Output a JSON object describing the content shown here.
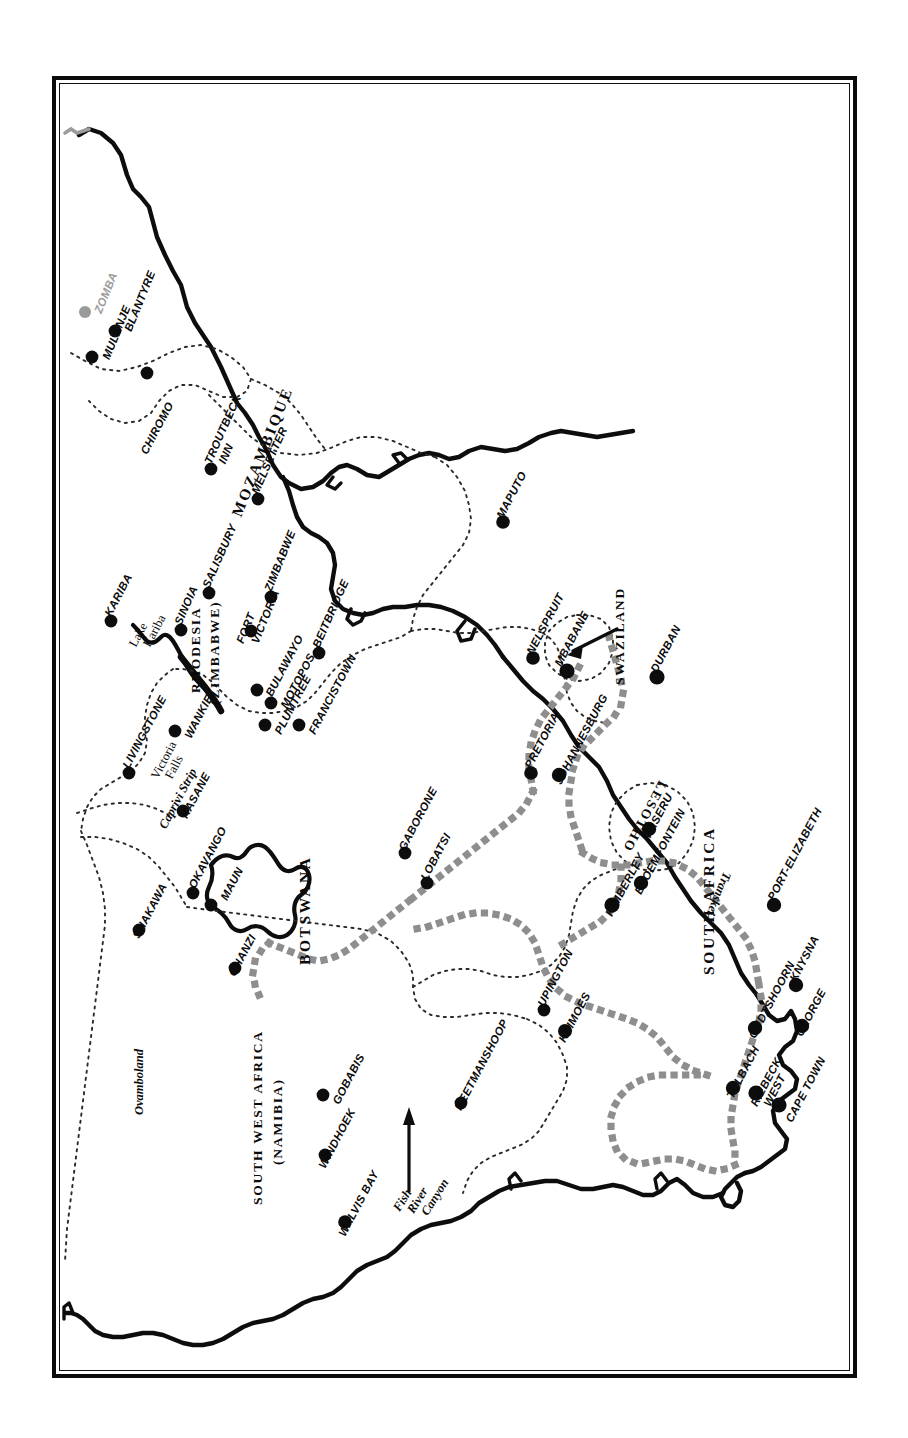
{
  "document": {
    "type": "map",
    "title": "Southern Africa",
    "orientation": "rotated-90",
    "frame_style": "double-rule-black-border",
    "background_color": "#ffffff",
    "ink_color": "#0d0d0d",
    "muted_color": "#9a9a9a"
  },
  "legend_keys": {
    "coastline": "solid thick black line",
    "international_border": "fine dotted line",
    "route_track": "bold grey square-dotted line",
    "city_marker": "filled black circle",
    "city_marker_muted": "filled grey circle"
  },
  "countries": [
    {
      "name": "MOZAMBIQUE"
    },
    {
      "name": "RHODESIA\n(ZIMBABWE)"
    },
    {
      "name": "BOTSWANA"
    },
    {
      "name": "SOUTH WEST AFRICA\n(NAMIBIA)"
    },
    {
      "name": "SOUTH AFRICA"
    },
    {
      "name": "SWAZILAND"
    },
    {
      "name": "LESOTHO"
    }
  ],
  "country_labels": [
    {
      "id": "mozambique",
      "line1": "MOZAMBIQUE",
      "line2": ""
    },
    {
      "id": "rhodesia",
      "line1": "RHODESIA",
      "line2": "(ZIMBABWE)"
    },
    {
      "id": "botswana",
      "line1": "BOTSWANA",
      "line2": ""
    },
    {
      "id": "swa",
      "line1": "SOUTH WEST AFRICA",
      "line2": "(NAMIBIA)"
    },
    {
      "id": "southafrica",
      "line1": "SOUTH AFRICA",
      "line2": ""
    },
    {
      "id": "swaziland",
      "line1": "SWAZILAND",
      "line2": ""
    },
    {
      "id": "lesotho",
      "line1": "LESOTHO",
      "line2": ""
    }
  ],
  "regions": [
    {
      "id": "ovamboland",
      "label": "Ovamboland"
    },
    {
      "id": "caprivi",
      "label": "Caprivi Strip"
    },
    {
      "id": "transkei",
      "label": "Transkei"
    },
    {
      "id": "lake-kariba",
      "label": "Lake\nKariba",
      "line1": "Lake",
      "line2": "Kariba"
    },
    {
      "id": "victoria-falls",
      "label": "Victoria\nFalls",
      "line1": "Victoria",
      "line2": "Falls"
    },
    {
      "id": "fish-river-canyon",
      "label": "Fish\nRiver\nCanyon",
      "line1": "Fish",
      "line2": "River",
      "line3": "Canyon"
    }
  ],
  "cities": [
    {
      "name": "ZOMBA",
      "muted": true
    },
    {
      "name": "BLANTYRE",
      "muted": false
    },
    {
      "name": "MULANJE",
      "muted": false
    },
    {
      "name": "CHIROMO",
      "muted": false
    },
    {
      "name": "TROUTBECK INN",
      "line1": "TROUTBECK",
      "line2": "INN",
      "muted": false
    },
    {
      "name": "MELSETTER",
      "muted": false
    },
    {
      "name": "SALISBURY",
      "muted": false
    },
    {
      "name": "SINOIA",
      "muted": false
    },
    {
      "name": "ZIMBABWE",
      "muted": false
    },
    {
      "name": "FORT VICTORIA",
      "line1": "FORT",
      "line2": "VICTORIA",
      "muted": false
    },
    {
      "name": "BEITBRIDGE",
      "muted": false
    },
    {
      "name": "MOTOPOS",
      "muted": false
    },
    {
      "name": "BULAWAYO",
      "muted": false
    },
    {
      "name": "PLUMTREE",
      "muted": false
    },
    {
      "name": "FRANCISTOWN",
      "muted": false
    },
    {
      "name": "KARIBA",
      "muted": false
    },
    {
      "name": "WANKIE",
      "muted": false
    },
    {
      "name": "LIVINGSTONE",
      "muted": false
    },
    {
      "name": "KASANE",
      "muted": false
    },
    {
      "name": "OKAVANGO",
      "muted": false
    },
    {
      "name": "MAUN",
      "muted": false
    },
    {
      "name": "SHAKAWA",
      "muted": false
    },
    {
      "name": "GHANZI",
      "muted": false
    },
    {
      "name": "GABORONE",
      "muted": false
    },
    {
      "name": "LOBATSI",
      "muted": false
    },
    {
      "name": "GOBABIS",
      "muted": false
    },
    {
      "name": "WINDHOEK",
      "muted": false
    },
    {
      "name": "WALVIS BAY",
      "muted": false
    },
    {
      "name": "KEETMANSHOOP",
      "muted": false
    },
    {
      "name": "UPINGTON",
      "muted": false
    },
    {
      "name": "KEIMOES",
      "muted": false
    },
    {
      "name": "MAPUTO",
      "muted": false
    },
    {
      "name": "NELSPRUIT",
      "muted": false
    },
    {
      "name": "MBABANE",
      "muted": false
    },
    {
      "name": "PRETORIA",
      "muted": false
    },
    {
      "name": "JOHANNESBURG",
      "muted": false
    },
    {
      "name": "DURBAN",
      "muted": false
    },
    {
      "name": "MASERU",
      "muted": false
    },
    {
      "name": "BLOEMFONTEIN",
      "muted": false
    },
    {
      "name": "KIMBERLEY",
      "muted": false
    },
    {
      "name": "PORT ELIZABETH",
      "name_display": "PORT-ELIZABETH",
      "muted": false
    },
    {
      "name": "KNYSNA",
      "muted": false
    },
    {
      "name": "GEORGE",
      "muted": false
    },
    {
      "name": "OUDTSHOORN",
      "muted": false
    },
    {
      "name": "TULBACH",
      "muted": false
    },
    {
      "name": "RIEBECK WEST",
      "line1": "RIEBECK",
      "line2": "WEST",
      "muted": false
    },
    {
      "name": "CAPE TOWN",
      "muted": false
    }
  ],
  "labels": {
    "zomba": "ZOMBA",
    "blantyre": "BLANTYRE",
    "mulanje": "MULANJE",
    "chiromo": "CHIROMO",
    "troutbeck": "TROUTBECK",
    "inn": "INN",
    "melsetter": "MELSETTER",
    "salisbury": "SALISBURY",
    "sinoia": "SINOIA",
    "zimbabwe_city": "ZIMBABWE",
    "fort": "FORT",
    "victoria": "VICTORIA",
    "beitbridge": "BEITBRIDGE",
    "motopos": "MOTOPOS",
    "bulawayo": "BULAWAYO",
    "plumtree": "PLUMTREE",
    "francistown": "FRANCISTOWN",
    "kariba": "KARIBA",
    "wankie": "WANKIE",
    "livingstone": "LIVINGSTONE",
    "kasane": "KASANE",
    "okavango": "OKAVANGO",
    "maun": "MAUN",
    "shakawa": "SHAKAWA",
    "ghanzi": "GHANZI",
    "gaborone": "GABORONE",
    "lobatsi": "LOBATSI",
    "gobabis": "GOBABIS",
    "windhoek": "WINDHOEK",
    "walvisbay": "WALVIS BAY",
    "keetmanshoop": "KEETMANSHOOP",
    "upington": "UPINGTON",
    "keimoes": "KEIMOES",
    "maputo": "MAPUTO",
    "nelspruit": "NELSPRUIT",
    "mbabane": "MBABANE",
    "pretoria": "PRETORIA",
    "johannesburg": "JOHANNESBURG",
    "durban": "DURBAN",
    "maseru": "MASERU",
    "bloemfontein": "BLOEMFONTEIN",
    "kimberley": "KIMBERLEY",
    "portelizabeth": "PORT-ELIZABETH",
    "knysna": "KNYSNA",
    "george": "GEORGE",
    "oudtshoorn": "OUDTSHOORN",
    "tulbach": "TULBACH",
    "riebeck": "RIEBECK",
    "west": "WEST",
    "capetown": "CAPE TOWN",
    "mozambique": "MOZAMBIQUE",
    "rhodesia": "RHODESIA",
    "zimbabwe_paren": "(ZIMBABWE)",
    "botswana": "BOTSWANA",
    "swa1": "SOUTH WEST AFRICA",
    "swa2": "(NAMIBIA)",
    "southafrica": "SOUTH AFRICA",
    "swaziland": "SWAZILAND",
    "lesotho": "LESOTHO",
    "ovamboland": "Ovamboland",
    "caprivi": "Caprivi Strip",
    "transkei": "Transkei",
    "lake": "Lake",
    "kariba_lake": "Kariba",
    "victoria_f": "Victoria",
    "falls": "Falls",
    "fish": "Fish",
    "river": "River",
    "canyon": "Canyon"
  }
}
